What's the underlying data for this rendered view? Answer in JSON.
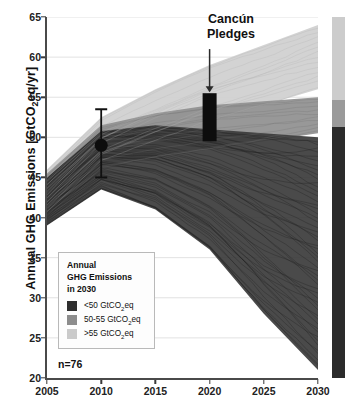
{
  "chart_data": {
    "type": "line",
    "title": "",
    "xlabel": "",
    "ylabel": "Annual GHG Emissions [GtCO2eq/yr]",
    "ylabel_prefix": "Annual GHG Emissions [GtCO",
    "ylabel_sub": "2",
    "ylabel_suffix": "eq/yr]",
    "xlim": [
      2005,
      2030
    ],
    "ylim": [
      20,
      65
    ],
    "xticks": [
      2005,
      2010,
      2015,
      2020,
      2025,
      2030
    ],
    "yticks": [
      20,
      25,
      30,
      35,
      40,
      45,
      50,
      55,
      60,
      65
    ],
    "grid": "horizontal",
    "legend_position": "lower-left",
    "sample_size_label": "n=76",
    "annotation": {
      "line1": "Cancún",
      "line2": "Pledges",
      "arrow": "down",
      "bar_year": 2020,
      "bar_range": [
        49.5,
        55.5
      ]
    },
    "observed_2010": {
      "year": 2010,
      "value": 49.0,
      "error_low": 45.0,
      "error_high": 53.5,
      "marker": "filled-circle"
    },
    "bands": [
      {
        "name": "<50 GtCO2eq",
        "color": "#3b3b3b",
        "count_share": 0.7,
        "x": [
          2005,
          2010,
          2015,
          2020,
          2025,
          2030
        ],
        "upper": [
          45.0,
          50.8,
          51.5,
          51.0,
          50.5,
          50.0
        ],
        "lower": [
          39.0,
          43.5,
          41.0,
          36.0,
          28.0,
          21.0
        ]
      },
      {
        "name": "50-55 GtCO2eq",
        "color": "#8f8f8f",
        "count_share": 0.13,
        "x": [
          2005,
          2010,
          2015,
          2020,
          2025,
          2030
        ],
        "upper": [
          45.5,
          51.5,
          53.0,
          54.0,
          54.5,
          55.0
        ],
        "lower": [
          40.0,
          46.0,
          47.5,
          48.5,
          49.5,
          50.5
        ]
      },
      {
        "name": ">55 GtCO2eq",
        "color": "#cfcfcf",
        "count_share": 0.17,
        "x": [
          2005,
          2010,
          2015,
          2020,
          2025,
          2030
        ],
        "upper": [
          46.0,
          52.5,
          56.0,
          59.0,
          61.5,
          64.0
        ],
        "lower": [
          40.5,
          47.0,
          49.5,
          52.0,
          54.0,
          56.0
        ]
      }
    ]
  },
  "yaxis": {
    "ticks": [
      "65",
      "60",
      "55",
      "50",
      "45",
      "40",
      "35",
      "30",
      "25",
      "20"
    ]
  },
  "xaxis": {
    "ticks": [
      "2005",
      "2010",
      "2015",
      "2020",
      "2025",
      "2030"
    ]
  },
  "annotation": {
    "line1": "Cancún",
    "line2": "Pledges"
  },
  "legend": {
    "title_line1": "Annual",
    "title_line2": "GHG Emissions",
    "title_line3": "in 2030",
    "items": [
      {
        "label_prefix": "<50 GtCO",
        "label_sub": "2",
        "label_suffix": "eq",
        "color": "#2d2d2d"
      },
      {
        "label_prefix": "50-55 GtCO",
        "label_sub": "2",
        "label_suffix": "eq",
        "color": "#8c8c8c"
      },
      {
        "label_prefix": ">55 GtCO",
        "label_sub": "2",
        "label_suffix": "eq",
        "color": "#cacaca"
      }
    ]
  },
  "sample": {
    "label": "n=76"
  },
  "colorbar": {
    "segments": [
      {
        "name": ">55 GtCO2eq",
        "color": "#cccccc",
        "top_pct": 0,
        "height_pct": 23
      },
      {
        "name": "50-55 GtCO2eq",
        "color": "#9a9a9a",
        "top_pct": 23,
        "height_pct": 7.5
      },
      {
        "name": "<50 GtCO2eq",
        "color": "#2b2b2b",
        "top_pct": 30.5,
        "height_pct": 69.5
      }
    ]
  }
}
